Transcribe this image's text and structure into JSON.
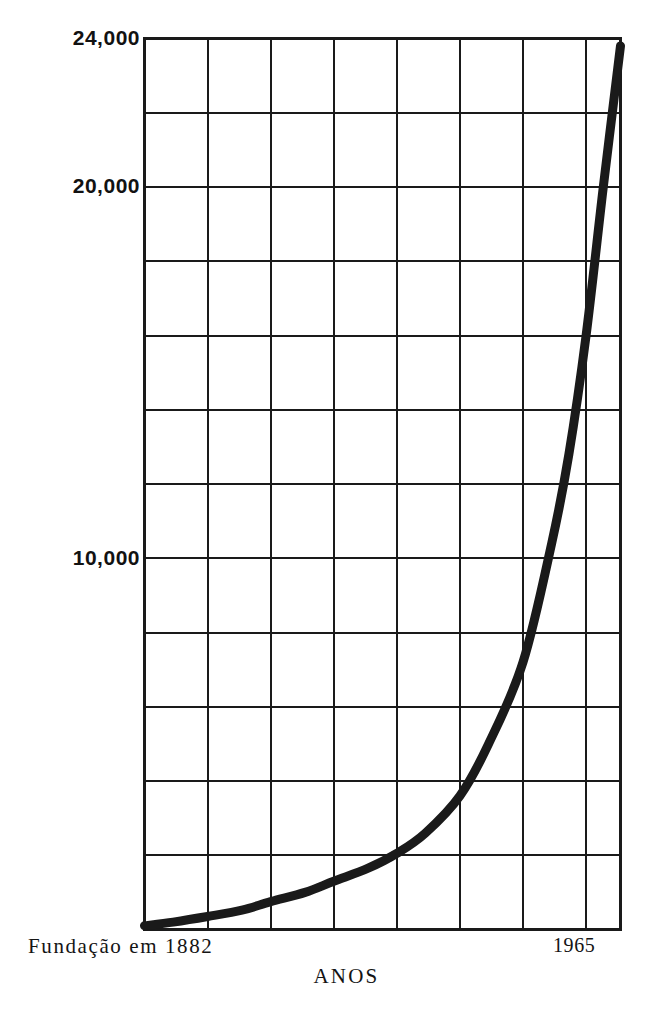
{
  "figure": {
    "background_color": "#ffffff",
    "ink_color": "#1a1a1a"
  },
  "chart_data": {
    "type": "line",
    "title": "",
    "subtitle": "",
    "xlabel": "ANOS",
    "ylabel": "",
    "x_start_label": "Fundação em 1882",
    "x_end_label": "1965",
    "xlim": [
      1882,
      1965
    ],
    "ylim": [
      0,
      24000
    ],
    "grid": true,
    "grid_x_values": [
      1882,
      1893,
      1904,
      1915,
      1926,
      1937,
      1948,
      1959,
      1965
    ],
    "grid_y_values": [
      0,
      2000,
      4000,
      6000,
      8000,
      10000,
      12000,
      14000,
      16000,
      18000,
      20000,
      22000,
      24000
    ],
    "y_tick_labels": [
      {
        "value": 24000,
        "label": "24,000"
      },
      {
        "value": 20000,
        "label": "20,000"
      },
      {
        "value": 10000,
        "label": "10,000"
      }
    ],
    "legend": null,
    "legend_position": "none",
    "series": [
      {
        "name": "Associados",
        "color": "#1a1a1a",
        "line_width": 9,
        "x": [
          1882,
          1887,
          1893,
          1899,
          1904,
          1910,
          1915,
          1921,
          1926,
          1931,
          1937,
          1942,
          1948,
          1953,
          1956,
          1959,
          1962,
          1965
        ],
        "values": [
          100,
          200,
          350,
          520,
          750,
          1000,
          1300,
          1650,
          2050,
          2600,
          3600,
          5000,
          7200,
          10400,
          12800,
          16000,
          20000,
          23800
        ]
      }
    ],
    "annotations": []
  }
}
